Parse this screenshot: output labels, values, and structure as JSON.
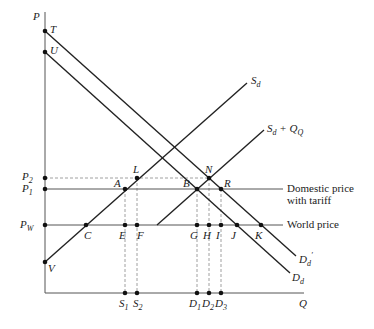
{
  "diagram": {
    "axes": {
      "y_label": "P",
      "x_label": "Q"
    },
    "price_levels": [
      {
        "id": "P2",
        "label": "P",
        "sub": "2",
        "y": 178
      },
      {
        "id": "P1",
        "label": "P",
        "sub": "1",
        "y": 189
      },
      {
        "id": "Pw",
        "label": "P",
        "sub": "W",
        "y": 225
      }
    ],
    "line_labels": {
      "domestic_price_line1": "Domestic price",
      "domestic_price_line2": "with tariff",
      "world_price": "World price"
    },
    "curves": [
      {
        "id": "Sd",
        "label": "S",
        "sub": "d",
        "extra": ""
      },
      {
        "id": "SdQQ",
        "label": "S",
        "sub": "d",
        "extra": " + Q",
        "extra_sub": "Q"
      },
      {
        "id": "Dd",
        "label": "D",
        "sub": "d"
      },
      {
        "id": "Dd_prime",
        "label": "D",
        "sub": "d",
        "prime": "′"
      }
    ],
    "points": {
      "T": "T",
      "U": "U",
      "V": "V",
      "L": "L",
      "N": "N",
      "A": "A",
      "B": "B",
      "R": "R",
      "C": "C",
      "E": "E",
      "F": "F",
      "G": "G",
      "H": "H",
      "I": "I",
      "J": "J",
      "K": "K"
    },
    "quantities": [
      {
        "id": "S1",
        "label": "S",
        "sub": "1"
      },
      {
        "id": "S2",
        "label": "S",
        "sub": "2"
      },
      {
        "id": "D1",
        "label": "D",
        "sub": "1"
      },
      {
        "id": "D2",
        "label": "D",
        "sub": "2"
      },
      {
        "id": "D3",
        "label": "D",
        "sub": "3"
      }
    ]
  }
}
